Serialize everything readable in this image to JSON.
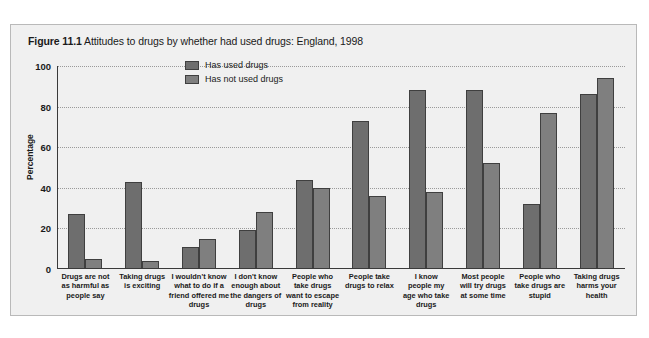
{
  "figure": {
    "number": "Figure 11.1",
    "title": "Attitudes to drugs by whether had used drugs: England, 1998"
  },
  "legend": {
    "position": "top-center",
    "items": [
      {
        "label": "Has used drugs",
        "color": "#6e6e6e"
      },
      {
        "label": "Has not used drugs",
        "color": "#7f7f7f"
      }
    ]
  },
  "chart_data": {
    "type": "bar",
    "title": "Attitudes to drugs by whether had used drugs: England, 1998",
    "xlabel": "",
    "ylabel": "Percentage",
    "ylim": [
      0,
      100
    ],
    "yticks": [
      0,
      20,
      40,
      60,
      80,
      100
    ],
    "grid": true,
    "legend_position": "top-center",
    "categories": [
      "Drugs are not as harmful as people say",
      "Taking drugs is exciting",
      "I wouldn't know what to do if a friend offered me drugs",
      "I don't know enough about the dangers of drugs",
      "People who take drugs want to escape from reality",
      "People take drugs to relax",
      "I know people my age who take drugs",
      "Most people will try drugs at some time",
      "People who take drugs are stupid",
      "Taking drugs harms your health"
    ],
    "category_lines": [
      [
        "Drugs are not",
        "as harmful as",
        "people say"
      ],
      [
        "Taking drugs",
        "is exciting"
      ],
      [
        "I wouldn't know",
        "what to do if a",
        "friend offered me",
        "drugs"
      ],
      [
        "I don't know",
        "enough about",
        "the dangers of",
        "drugs"
      ],
      [
        "People who",
        "take drugs",
        "want to escape",
        "from reality"
      ],
      [
        "People take",
        "drugs to relax"
      ],
      [
        "I know",
        "people my",
        "age who take",
        "drugs"
      ],
      [
        "Most people",
        "will try drugs",
        "at some time"
      ],
      [
        "People who",
        "take drugs are",
        "stupid"
      ],
      [
        "Taking drugs",
        "harms your",
        "health"
      ]
    ],
    "series": [
      {
        "name": "Has used drugs",
        "color": "#6e6e6e",
        "values": [
          27,
          43,
          11,
          19,
          44,
          73,
          88,
          88,
          32,
          86
        ]
      },
      {
        "name": "Has not used drugs",
        "color": "#7f7f7f",
        "values": [
          5,
          4,
          15,
          28,
          40,
          36,
          38,
          52,
          77,
          94
        ]
      }
    ]
  },
  "axis": {
    "y_title": "Percentage",
    "y_tick_labels": [
      "0",
      "20",
      "40",
      "60",
      "80",
      "100"
    ]
  }
}
